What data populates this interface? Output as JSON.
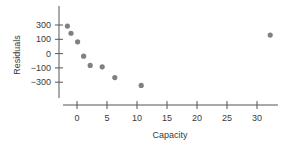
{
  "chart_data": {
    "type": "scatter",
    "title": "",
    "xlabel": "Capacity",
    "ylabel": "Residuals",
    "x_ticks": [
      0,
      5,
      10,
      15,
      20,
      25,
      30
    ],
    "y_tick_labels": [
      "300",
      "100",
      "0",
      "−100",
      "−300"
    ],
    "xlim": [
      -3.5,
      33.5
    ],
    "grid": false,
    "legend": null,
    "points": [
      {
        "x": -1.6,
        "y": 290
      },
      {
        "x": -1.0,
        "y": 190
      },
      {
        "x": 0.1,
        "y": 85
      },
      {
        "x": 1.1,
        "y": -15
      },
      {
        "x": 2.2,
        "y": -80
      },
      {
        "x": 4.2,
        "y": -90
      },
      {
        "x": 6.3,
        "y": -230
      },
      {
        "x": 10.7,
        "y": -340
      },
      {
        "x": 32.2,
        "y": 165
      }
    ],
    "marker_color": "#808080",
    "axis_color": "#555555"
  }
}
